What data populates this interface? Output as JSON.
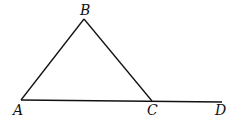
{
  "diagram": {
    "type": "geometry-triangle",
    "points": {
      "A": {
        "label": "A",
        "x": 21,
        "y": 100
      },
      "B": {
        "label": "B",
        "x": 84,
        "y": 19
      },
      "C": {
        "label": "C",
        "x": 152,
        "y": 101
      },
      "D": {
        "label": "D",
        "x": 222,
        "y": 102
      }
    },
    "segments": [
      [
        "A",
        "B"
      ],
      [
        "B",
        "C"
      ],
      [
        "A",
        "C"
      ],
      [
        "C",
        "D"
      ]
    ],
    "stroke_color": "#111111"
  }
}
